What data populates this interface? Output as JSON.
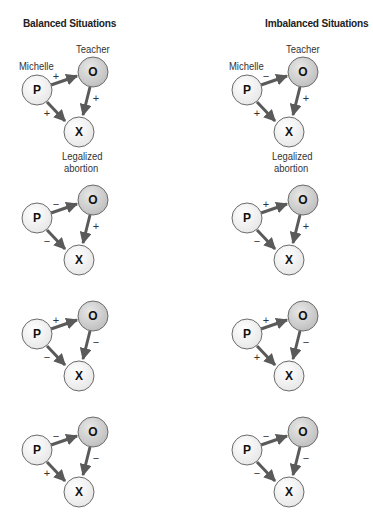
{
  "columns": [
    {
      "title": "Balanced Situations",
      "labels": {
        "person": "Michelle",
        "other": "Teacher",
        "object_line1": "Legalized",
        "object_line2": "abortion"
      },
      "diagrams": [
        {
          "po": "+",
          "ox": "+",
          "px": "+"
        },
        {
          "po": "−",
          "ox": "+",
          "px": "−"
        },
        {
          "po": "+",
          "ox": "−",
          "px": "−"
        },
        {
          "po": "−",
          "ox": "−",
          "px": "+"
        }
      ]
    },
    {
      "title": "Imbalanced Situations",
      "labels": {
        "person": "Michelle",
        "other": "Teacher",
        "object_line1": "Legalized",
        "object_line2": "abortion"
      },
      "diagrams": [
        {
          "po": "−",
          "ox": "+",
          "px": "+"
        },
        {
          "po": "+",
          "ox": "+",
          "px": "−"
        },
        {
          "po": "+",
          "ox": "−",
          "px": "+"
        },
        {
          "po": "−",
          "ox": "−",
          "px": "−"
        }
      ]
    }
  ],
  "nodes": {
    "p": "P",
    "o": "O",
    "x": "X"
  },
  "colors": {
    "arrow": "#5a5a5a",
    "node_white": "#fbfbfb",
    "node_gray": "#d9d9d9",
    "node_stroke": "#6a6a6a"
  }
}
